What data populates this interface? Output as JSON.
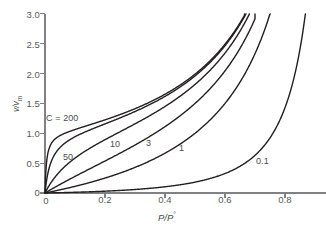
{
  "chart_data": {
    "type": "line",
    "title": "",
    "xlabel": "P/P°",
    "ylabel": "v/vm",
    "xlim": [
      0,
      0.94
    ],
    "ylim": [
      0,
      3.0
    ],
    "grid": false,
    "legend": "inline-curve-labels",
    "equation": "v/vm = C*x / ((1-x)*(1-x+C*x))",
    "xticks": [
      0,
      0.2,
      0.4,
      0.6,
      0.8
    ],
    "xticklabels": [
      "0",
      "0.2",
      "0.4",
      "0.6",
      "0.8"
    ],
    "yticks": [
      0,
      0.5,
      1.0,
      1.5,
      2.0,
      2.5,
      3.0
    ],
    "yticklabels": [
      "0",
      "0.5",
      "1.0",
      "1.5",
      "2.0",
      "2.5",
      "3.0"
    ],
    "series": [
      {
        "name": "C = 200",
        "C": 200,
        "label": "C = 200",
        "label_x": 0.055,
        "label_y": 1.28,
        "x": [
          0.0,
          0.005,
          0.01,
          0.02,
          0.03,
          0.05,
          0.08,
          0.12,
          0.16,
          0.2,
          0.25,
          0.3,
          0.35,
          0.4,
          0.45,
          0.5,
          0.55,
          0.6,
          0.63,
          0.65,
          0.665
        ],
        "y": [
          0.0,
          0.49,
          0.66,
          0.8,
          0.85,
          0.9,
          0.95,
          1.01,
          1.07,
          1.13,
          1.22,
          1.32,
          1.43,
          1.57,
          1.73,
          1.94,
          2.2,
          2.56,
          2.84,
          3.0,
          3.0
        ]
      },
      {
        "name": "C = 50",
        "C": 50,
        "label": "50",
        "label_x": 0.09,
        "label_y": 0.62,
        "x": [
          0.0,
          0.01,
          0.02,
          0.04,
          0.06,
          0.09,
          0.13,
          0.17,
          0.21,
          0.26,
          0.31,
          0.36,
          0.41,
          0.46,
          0.51,
          0.56,
          0.61,
          0.64,
          0.67
        ],
        "y": [
          0.0,
          0.32,
          0.49,
          0.66,
          0.75,
          0.83,
          0.9,
          0.97,
          1.04,
          1.13,
          1.23,
          1.35,
          1.48,
          1.65,
          1.86,
          2.13,
          2.5,
          2.79,
          3.0
        ]
      },
      {
        "name": "C = 10",
        "C": 10,
        "label": "10",
        "label_x": 0.22,
        "label_y": 0.88,
        "x": [
          0.0,
          0.02,
          0.04,
          0.07,
          0.1,
          0.14,
          0.18,
          0.23,
          0.28,
          0.33,
          0.38,
          0.43,
          0.48,
          0.53,
          0.58,
          0.62,
          0.66,
          0.685
        ],
        "y": [
          0.0,
          0.17,
          0.3,
          0.44,
          0.55,
          0.66,
          0.76,
          0.86,
          0.96,
          1.07,
          1.19,
          1.33,
          1.5,
          1.72,
          2.0,
          2.3,
          2.75,
          3.0
        ]
      },
      {
        "name": "C = 3",
        "C": 3,
        "label": "3",
        "label_x": 0.33,
        "label_y": 0.88,
        "x": [
          0.0,
          0.03,
          0.06,
          0.1,
          0.15,
          0.2,
          0.25,
          0.3,
          0.35,
          0.4,
          0.45,
          0.5,
          0.55,
          0.6,
          0.64,
          0.68,
          0.7
        ],
        "y": [
          0.0,
          0.09,
          0.17,
          0.27,
          0.38,
          0.48,
          0.58,
          0.67,
          0.78,
          0.89,
          1.02,
          1.18,
          1.38,
          1.67,
          2.0,
          2.6,
          3.0
        ]
      },
      {
        "name": "C = 1",
        "C": 1,
        "label": "1",
        "label_x": 0.44,
        "label_y": 0.82,
        "x": [
          0.0,
          0.05,
          0.1,
          0.15,
          0.2,
          0.25,
          0.3,
          0.35,
          0.4,
          0.45,
          0.5,
          0.55,
          0.6,
          0.65,
          0.7,
          0.73,
          0.755
        ],
        "y": [
          0.0,
          0.05,
          0.11,
          0.18,
          0.25,
          0.33,
          0.43,
          0.54,
          0.67,
          0.82,
          1.0,
          1.22,
          1.5,
          1.86,
          2.33,
          2.7,
          3.0
        ]
      },
      {
        "name": "C = 0.1",
        "C": 0.1,
        "label": "0.1",
        "label_x": 0.77,
        "label_y": 0.55,
        "x": [
          0.0,
          0.1,
          0.2,
          0.3,
          0.4,
          0.45,
          0.5,
          0.55,
          0.6,
          0.65,
          0.7,
          0.75,
          0.78,
          0.81,
          0.835,
          0.855,
          0.868
        ],
        "y": [
          0.0,
          0.012,
          0.028,
          0.05,
          0.08,
          0.1,
          0.125,
          0.155,
          0.2,
          0.26,
          0.35,
          0.5,
          0.63,
          0.85,
          1.15,
          1.7,
          3.0
        ]
      }
    ],
    "style": {
      "curve_color": "#231f20",
      "axis_color": "#808184",
      "text_color": "#58585a",
      "background": "#ffffff",
      "line_width": 1.4
    }
  },
  "axes": {
    "x_title_main": "P/P",
    "x_title_sup": "°",
    "y_title": "v/vm",
    "y_title_main": "v/v",
    "y_title_sub": "m"
  }
}
